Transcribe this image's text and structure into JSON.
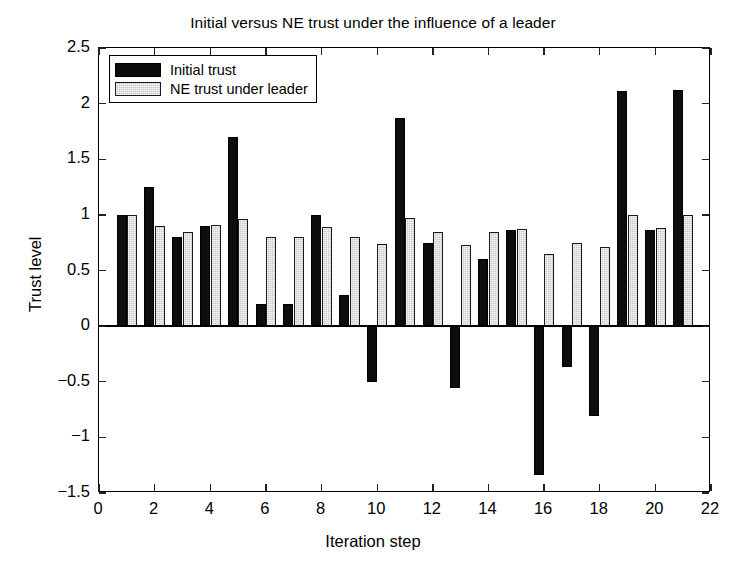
{
  "chart_data": {
    "type": "bar",
    "title": "Initial versus NE trust under the influence of a leader",
    "xlabel": "Iteration step",
    "ylabel": "Trust level",
    "xlim": [
      0,
      22
    ],
    "ylim": [
      -1.5,
      2.5
    ],
    "xticks": [
      0,
      2,
      4,
      6,
      8,
      10,
      12,
      14,
      16,
      18,
      20,
      22
    ],
    "xtick_labels": [
      "0",
      "2",
      "4",
      "6",
      "8",
      "10",
      "12",
      "14",
      "16",
      "18",
      "20",
      "22"
    ],
    "yticks": [
      -1.5,
      -1,
      -0.5,
      0,
      0.5,
      1,
      1.5,
      2,
      2.5
    ],
    "ytick_labels": [
      "-1.5",
      "-1",
      "-0.5",
      "0",
      "0.5",
      "1",
      "1.5",
      "2",
      "2.5"
    ],
    "grid": false,
    "legend_position": "upper-left",
    "categories": [
      1,
      2,
      3,
      4,
      5,
      6,
      7,
      8,
      9,
      10,
      11,
      12,
      13,
      14,
      15,
      16,
      17,
      18,
      19,
      20,
      21
    ],
    "series": [
      {
        "name": "Initial trust",
        "color": "#0d0d0d",
        "values": [
          1.0,
          1.25,
          0.8,
          0.9,
          1.7,
          0.2,
          0.2,
          1.0,
          0.28,
          -0.5,
          1.87,
          0.75,
          -0.56,
          0.6,
          0.86,
          -1.34,
          -0.37,
          -0.81,
          2.11,
          0.86,
          2.12
        ]
      },
      {
        "name": "NE trust under leader",
        "color": "#c9c9c9",
        "values": [
          1.0,
          0.9,
          0.85,
          0.91,
          0.96,
          0.8,
          0.8,
          0.89,
          0.8,
          0.74,
          0.97,
          0.85,
          0.73,
          0.85,
          0.87,
          0.65,
          0.75,
          0.71,
          1.0,
          0.88,
          1.0
        ]
      }
    ]
  },
  "legend": {
    "entries": [
      {
        "label": "Initial trust",
        "swatch": "black"
      },
      {
        "label": "NE trust under leader",
        "swatch": "gray"
      }
    ]
  }
}
